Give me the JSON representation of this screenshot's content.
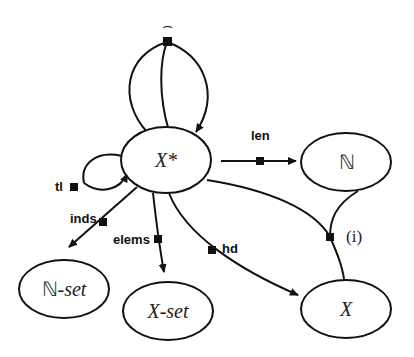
{
  "diagram": {
    "nodes": {
      "xstar": {
        "label": "X*"
      },
      "nat": {
        "label": "ℕ"
      },
      "natset": {
        "label_prefix": "ℕ",
        "label_suffix": "-set"
      },
      "xset": {
        "label": "X-set"
      },
      "x": {
        "label": "X"
      }
    },
    "edges": {
      "conc": {
        "label": "⌢"
      },
      "tl": {
        "label": "tl"
      },
      "len": {
        "label": "len"
      },
      "inds": {
        "label": "inds"
      },
      "elems": {
        "label": "elems"
      },
      "hd": {
        "label": "hd"
      },
      "index": {
        "label": "(i)"
      }
    }
  }
}
